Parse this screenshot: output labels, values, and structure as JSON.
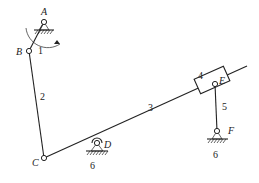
{
  "diagram": {
    "type": "planar-linkage-mechanism",
    "joints": [
      {
        "id": "A",
        "label": "A",
        "x": 44,
        "y": 22,
        "grounded": true
      },
      {
        "id": "B",
        "label": "B",
        "x": 29,
        "y": 51,
        "grounded": false
      },
      {
        "id": "C",
        "label": "C",
        "x": 44,
        "y": 158,
        "grounded": false
      },
      {
        "id": "D",
        "label": "D",
        "x": 97,
        "y": 143,
        "grounded": true
      },
      {
        "id": "E",
        "label": "E",
        "x": 215,
        "y": 84,
        "grounded": false
      },
      {
        "id": "F",
        "label": "F",
        "x": 217,
        "y": 131,
        "grounded": true
      }
    ],
    "links": [
      {
        "id": "1",
        "label": "1",
        "from": "A",
        "to": "B"
      },
      {
        "id": "2",
        "label": "2",
        "from": "B",
        "to": "C"
      },
      {
        "id": "3",
        "label": "3",
        "from": "C",
        "to": "D",
        "extends_through": "E"
      },
      {
        "id": "4",
        "label": "4",
        "type": "slider",
        "on": "3",
        "at": "E"
      },
      {
        "id": "5",
        "label": "5",
        "from": "E",
        "to": "F"
      }
    ],
    "ground_label": "6",
    "ground_labels": [
      {
        "at": "D",
        "label": "6"
      },
      {
        "at": "F",
        "label": "6"
      }
    ],
    "input_rotation_arrow": {
      "at": "A",
      "direction": "clockwise"
    }
  }
}
